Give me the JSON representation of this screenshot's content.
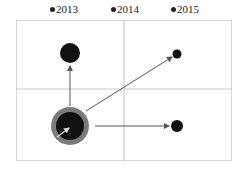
{
  "legend": {
    "items": [
      {
        "label": "2013",
        "x": 50
      },
      {
        "label": "2014",
        "x": 111
      },
      {
        "label": "2015",
        "x": 171
      }
    ]
  },
  "colors": {
    "frame": "#d4d4d4",
    "grid": "#c8c8c8",
    "bubble": "#111111",
    "ring": "#7a7a7a",
    "arrow": "#555555"
  }
}
